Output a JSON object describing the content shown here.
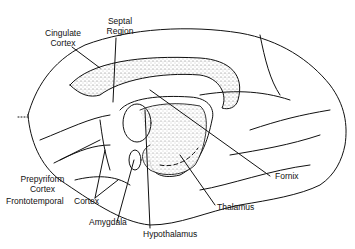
{
  "diagram": {
    "labels": {
      "cingulate_cortex": [
        "Cingulate",
        "Cortex"
      ],
      "septal_region": [
        "Septal",
        "Region"
      ],
      "prepyriform_cortex": [
        "Prepyriform",
        "Cortex"
      ],
      "frontotemporal": "Frontotemporal",
      "cortex": "Cortex",
      "amygdala": "Amygdala",
      "hypothalamus": "Hypothalamus",
      "thalamus": "Thalamus",
      "fornix": "Fornix"
    },
    "colors": {
      "line": "#111111",
      "stipple": "#9a9a9a",
      "background": "#ffffff"
    }
  }
}
